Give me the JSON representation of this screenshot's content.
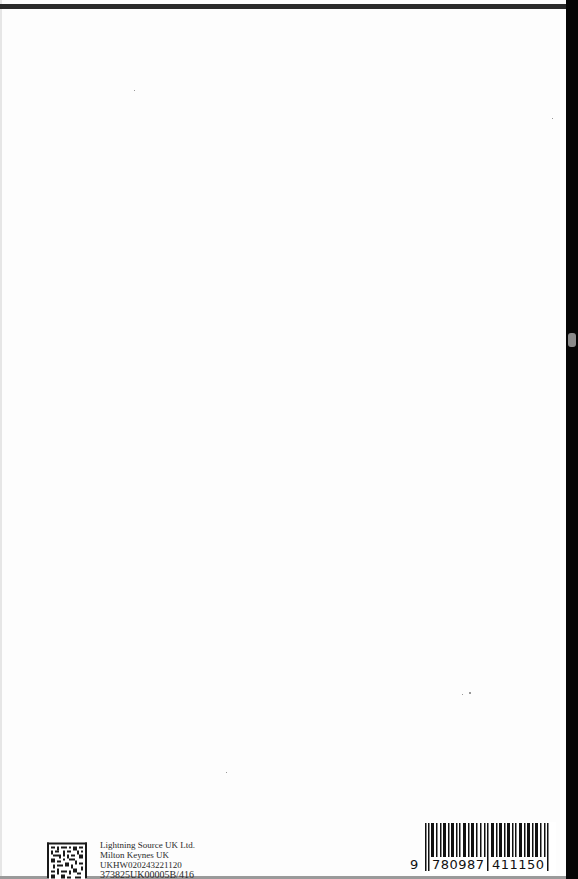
{
  "page": {
    "type": "book-back-page",
    "colors": {
      "background": "#fdfdfd",
      "rule": "#2a2a2a",
      "edge": "#050505",
      "text": "#2a2a2a"
    }
  },
  "printer": {
    "lines": [
      "Lightning Source UK Ltd.",
      "Milton Keynes UK",
      "UKHW020243221120",
      "373825UK00005B/416"
    ]
  },
  "qr_code": {
    "icon": "data-matrix-code-icon"
  },
  "barcode": {
    "icon": "barcode-icon",
    "isbn_prefix": "9",
    "isbn_group_1": "780987",
    "isbn_group_2": "411150"
  }
}
